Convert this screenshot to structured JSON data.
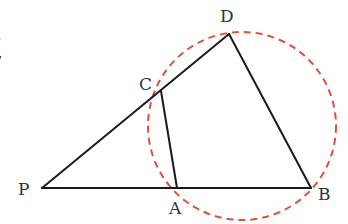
{
  "diagram": {
    "type": "geometry",
    "colors": {
      "line": "#1a1a1a",
      "circle": "#e0503a",
      "label": "#333333"
    },
    "points": {
      "P": {
        "label": "P",
        "x": 42,
        "y": 188
      },
      "A": {
        "label": "A",
        "x": 177,
        "y": 188
      },
      "B": {
        "label": "B",
        "x": 311,
        "y": 188
      },
      "C": {
        "label": "C",
        "x": 161,
        "y": 91
      },
      "D": {
        "label": "D",
        "x": 229,
        "y": 34
      }
    },
    "segments": [
      {
        "from": "P",
        "to": "D"
      },
      {
        "from": "P",
        "to": "B"
      },
      {
        "from": "C",
        "to": "A"
      },
      {
        "from": "D",
        "to": "B"
      }
    ],
    "circle": {
      "cx": 242,
      "cy": 126,
      "r": 94,
      "style": "dashed"
    },
    "edge_fragment": {
      "line1": "·",
      "line2": ","
    }
  }
}
